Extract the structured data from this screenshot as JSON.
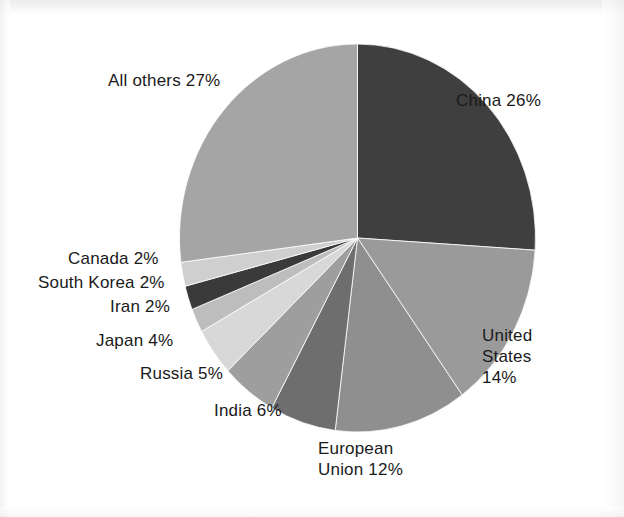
{
  "figure": {
    "background_color": "#ffffff",
    "label_text_color": "#1a1a1a"
  },
  "chart_data": {
    "type": "pie",
    "title": "",
    "subtitle": "",
    "xlabel": "",
    "ylabel": "",
    "legend_position": "none",
    "grid": false,
    "start_angle_deg": 0,
    "direction": "clockwise",
    "units": "percent",
    "categories": [
      "China",
      "United States",
      "European Union",
      "India",
      "Russia",
      "Japan",
      "Iran",
      "South Korea",
      "Canada",
      "All others"
    ],
    "values": [
      26,
      14,
      12,
      6,
      5,
      4,
      2,
      2,
      2,
      27
    ],
    "slice_colors": [
      "#3f3f3f",
      "#9a9a9a",
      "#8f8f8f",
      "#6e6e6e",
      "#9e9e9e",
      "#d8d8d8",
      "#bdbdbd",
      "#3a3a3a",
      "#cfcfcf",
      "#a5a5a5"
    ],
    "labels": [
      "China 26%",
      "United States 14%",
      "European Union 12%",
      "India 6%",
      "Russia 5%",
      "Japan 4%",
      "Iran 2%",
      "South Korea 2%",
      "Canada 2%",
      "All others 27%"
    ]
  },
  "labels": {
    "all_others": "All others 27%",
    "china": "China 26%",
    "united_states": "United\nStates\n14%",
    "european_union": "European\nUnion 12%",
    "india": "India 6%",
    "russia": "Russia 5%",
    "japan": "Japan 4%",
    "iran": "Iran 2%",
    "south_korea": "South Korea 2%",
    "canada": "Canada 2%"
  }
}
